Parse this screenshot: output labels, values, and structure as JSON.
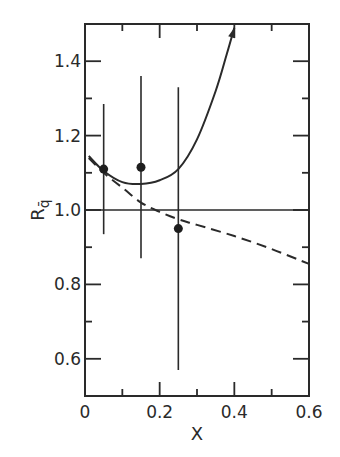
{
  "chart_data": {
    "type": "scatter",
    "title": "",
    "xlabel": "X",
    "ylabel": "R",
    "ylabel_subscript": "q̄",
    "xlim": [
      0,
      0.6
    ],
    "ylim": [
      0.5,
      1.5
    ],
    "grid": false,
    "reference_line": {
      "y": 1.0
    },
    "x_ticks": [
      {
        "v": 0,
        "label": "0"
      },
      {
        "v": 0.2,
        "label": "0.2"
      },
      {
        "v": 0.4,
        "label": "0.4"
      },
      {
        "v": 0.6,
        "label": "0.6"
      }
    ],
    "x_minor_ticks": [
      0.1,
      0.3,
      0.5
    ],
    "y_ticks": [
      {
        "v": 0.6,
        "label": "0.6"
      },
      {
        "v": 0.8,
        "label": "0.8"
      },
      {
        "v": 1.0,
        "label": "1.0"
      },
      {
        "v": 1.2,
        "label": "1.2"
      },
      {
        "v": 1.4,
        "label": "1.4"
      }
    ],
    "y_minor_ticks": [
      0.7,
      0.9,
      1.1,
      1.3
    ],
    "points": [
      {
        "x": 0.05,
        "y": 1.11,
        "err_low": 0.935,
        "err_high": 1.285
      },
      {
        "x": 0.15,
        "y": 1.115,
        "err_low": 0.87,
        "err_high": 1.36
      },
      {
        "x": 0.25,
        "y": 0.95,
        "err_low": 0.57,
        "err_high": 1.33
      }
    ],
    "series": [
      {
        "name": "solid-curve",
        "style": "solid",
        "arrow_end": true,
        "x": [
          0.01,
          0.05,
          0.1,
          0.15,
          0.2,
          0.25,
          0.3,
          0.35,
          0.38,
          0.4
        ],
        "y": [
          1.145,
          1.105,
          1.075,
          1.07,
          1.08,
          1.11,
          1.19,
          1.32,
          1.42,
          1.49
        ]
      },
      {
        "name": "dashed-curve",
        "style": "dashed",
        "x": [
          0.01,
          0.05,
          0.1,
          0.15,
          0.2,
          0.25,
          0.3,
          0.4,
          0.5,
          0.6
        ],
        "y": [
          1.14,
          1.1,
          1.06,
          1.02,
          0.995,
          0.975,
          0.96,
          0.93,
          0.895,
          0.855
        ]
      }
    ]
  }
}
